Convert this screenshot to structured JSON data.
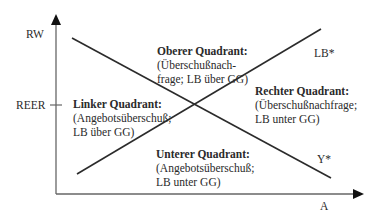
{
  "axes": {
    "y_label": "RW",
    "x_label": "A",
    "y_tick_label": "REER"
  },
  "curves": {
    "ascending": "LB*",
    "descending": "Y*"
  },
  "quadrants": {
    "top": {
      "title": "Oberer Quadrant:",
      "line1": "(Überschußnach-",
      "line2": "frage; LB über GG)"
    },
    "left": {
      "title": "Linker Quadrant:",
      "line1": "(Angebotsüberschuß;",
      "line2": "LB über GG)"
    },
    "right": {
      "title": "Rechter Quadrant:",
      "line1": "(Überschußnachfrage;",
      "line2": "LB unter GG)"
    },
    "bottom": {
      "title": "Unterer Quadrant:",
      "line1": "(Angebotsüberschuß;",
      "line2": "LB unter GG)"
    }
  },
  "colors": {
    "line": "#2b2b2b",
    "axis": "#555555",
    "background": "#ffffff"
  }
}
